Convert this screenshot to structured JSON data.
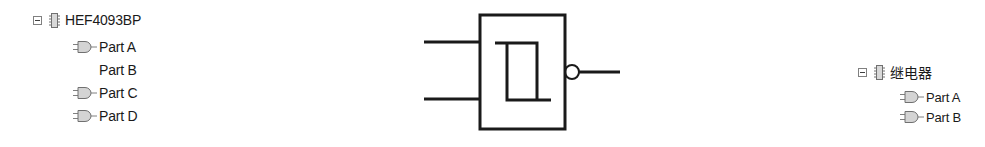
{
  "left_tree": {
    "root": {
      "label": "HEF4093BP",
      "expanded": true,
      "icon": "ic-chip-icon"
    },
    "children": [
      {
        "label": "Part A",
        "icon": "gate-part-icon",
        "has_icon": true
      },
      {
        "label": "Part B",
        "icon": "",
        "has_icon": false
      },
      {
        "label": "Part C",
        "icon": "gate-part-icon",
        "has_icon": true
      },
      {
        "label": "Part D",
        "icon": "gate-part-icon",
        "has_icon": true
      }
    ]
  },
  "symbol": {
    "type": "schmitt-trigger-nand-gate",
    "inputs": 2,
    "outputs": 1,
    "output_inverted": true
  },
  "right_tree": {
    "root": {
      "label": "继电器",
      "expanded": true,
      "icon": "ic-chip-icon"
    },
    "children": [
      {
        "label": "Part A",
        "icon": "gate-part-icon",
        "has_icon": true
      },
      {
        "label": "Part B",
        "icon": "gate-part-icon",
        "has_icon": true
      }
    ]
  }
}
